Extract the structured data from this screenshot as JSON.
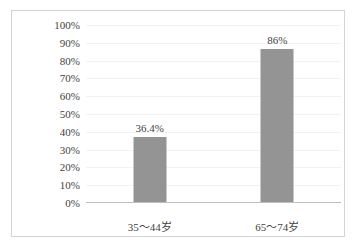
{
  "chart_data": {
    "type": "bar",
    "title": "",
    "subtitle": "",
    "xlabel": "",
    "ylabel": "",
    "categories": [
      "35～44岁",
      "65～74岁"
    ],
    "values": [
      36.4,
      86
    ],
    "value_labels": [
      "36.4%",
      "86%"
    ],
    "ylim": [
      0,
      100
    ],
    "y_ticks": [
      0,
      10,
      20,
      30,
      40,
      50,
      60,
      70,
      80,
      90,
      100
    ],
    "y_tick_labels": [
      "0%",
      "10%",
      "20%",
      "30%",
      "40%",
      "50%",
      "60%",
      "70%",
      "80%",
      "90%",
      "100%"
    ],
    "grid": true,
    "legend": false,
    "legend_position": "none",
    "bar_color": "#949494",
    "axis_color": "#bcbcbc",
    "gridline_color": "#f2f2f2",
    "border_color": "#d4d4d4",
    "text_color": "#3f3f3f"
  }
}
